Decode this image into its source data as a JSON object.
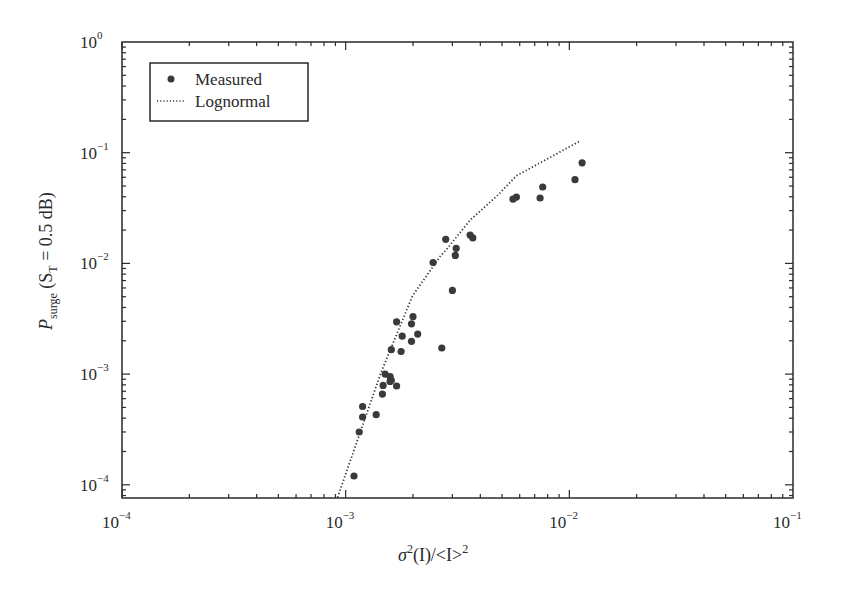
{
  "chart_data": {
    "type": "scatter",
    "title": "",
    "xlabel": "σ²(I)/<I>²",
    "ylabel": "P_surge (S_T = 0.5 dB)",
    "xscale": "log",
    "yscale": "log",
    "xlim": [
      0.0001,
      0.1
    ],
    "ylim": [
      7.6e-05,
      1
    ],
    "grid": false,
    "legend_position": "upper left",
    "x_ticks": [
      {
        "base": "10",
        "exp": "−4",
        "value": 0.0001
      },
      {
        "base": "10",
        "exp": "−3",
        "value": 0.001
      },
      {
        "base": "10",
        "exp": "−2",
        "value": 0.01
      },
      {
        "base": "10",
        "exp": "−1",
        "value": 0.1
      }
    ],
    "y_ticks": [
      {
        "base": "10",
        "exp": "0",
        "value": 1
      },
      {
        "base": "10",
        "exp": "−1",
        "value": 0.1
      },
      {
        "base": "10",
        "exp": "−2",
        "value": 0.01
      },
      {
        "base": "10",
        "exp": "−3",
        "value": 0.001
      },
      {
        "base": "10",
        "exp": "−4",
        "value": 0.0001
      }
    ],
    "series": [
      {
        "name": "Measured",
        "style": "markers",
        "color": "#3a3a3a",
        "points": [
          [
            0.00109,
            0.00012
          ],
          [
            0.00115,
            0.0003
          ],
          [
            0.00119,
            0.00041
          ],
          [
            0.00119,
            0.00051
          ],
          [
            0.00137,
            0.00043
          ],
          [
            0.00146,
            0.00066
          ],
          [
            0.00147,
            0.00079
          ],
          [
            0.0015,
            0.001
          ],
          [
            0.00158,
            0.00095
          ],
          [
            0.0016,
            0.00088
          ],
          [
            0.00158,
            0.00086
          ],
          [
            0.00169,
            0.00078
          ],
          [
            0.0016,
            0.00166
          ],
          [
            0.00177,
            0.0016
          ],
          [
            0.00169,
            0.00297
          ],
          [
            0.00179,
            0.0022
          ],
          [
            0.00197,
            0.00198
          ],
          [
            0.00197,
            0.00285
          ],
          [
            0.002,
            0.0033
          ],
          [
            0.0021,
            0.0023
          ],
          [
            0.00269,
            0.00172
          ],
          [
            0.00246,
            0.0102
          ],
          [
            0.0028,
            0.0165
          ],
          [
            0.003,
            0.0057
          ],
          [
            0.00309,
            0.0118
          ],
          [
            0.00312,
            0.0137
          ],
          [
            0.0036,
            0.018
          ],
          [
            0.0037,
            0.017
          ],
          [
            0.0056,
            0.038
          ],
          [
            0.0058,
            0.0397
          ],
          [
            0.0074,
            0.039
          ],
          [
            0.0076,
            0.049
          ],
          [
            0.0106,
            0.057
          ],
          [
            0.0114,
            0.081
          ]
        ]
      },
      {
        "name": "Lognormal",
        "style": "dotted-line",
        "color": "#3a3a3a",
        "points": [
          [
            0.00092,
            7.7e-05
          ],
          [
            0.00143,
            0.001
          ],
          [
            0.00199,
            0.0051
          ],
          [
            0.00265,
            0.0116
          ],
          [
            0.00285,
            0.0137
          ],
          [
            0.0036,
            0.0246
          ],
          [
            0.0048,
            0.0415
          ],
          [
            0.0058,
            0.062
          ],
          [
            0.0065,
            0.07
          ],
          [
            0.0112,
            0.128
          ]
        ]
      }
    ]
  },
  "legend": {
    "items": [
      {
        "label": "Measured",
        "symbol": "dot"
      },
      {
        "label": "Lognormal",
        "symbol": "dotted-line"
      }
    ]
  },
  "axes": {
    "x_title_sigma": "σ",
    "x_title_sup": "2",
    "x_title_rest": "(I)/<I>",
    "x_title_sup2": "2",
    "y_title_P": "P",
    "y_title_sub": "surge",
    "y_title_open": " (S",
    "y_title_sub2": "T",
    "y_title_close": " = 0.5 dB)"
  }
}
